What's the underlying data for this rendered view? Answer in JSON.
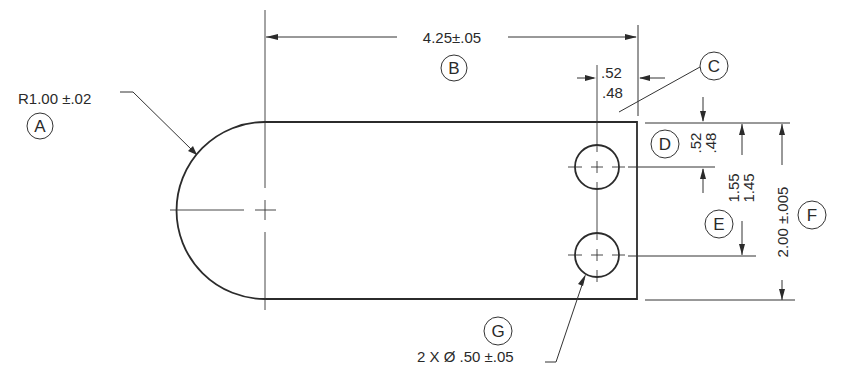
{
  "drawing": {
    "title": "Part drawing with dimension callouts",
    "callouts": [
      {
        "id": "A",
        "label": "A",
        "text": "R1.00 ±.02",
        "description": "Radius of rounded end"
      },
      {
        "id": "B",
        "label": "B",
        "text": "4.25±.05",
        "description": "Overall length from arc center to right edge"
      },
      {
        "id": "C",
        "label": "C",
        "text_upper": ".52",
        "text_lower": ".48",
        "description": "Hole center to right edge"
      },
      {
        "id": "D",
        "label": "D",
        "text_upper": ".52",
        "text_lower": ".48",
        "description": "Top edge to upper hole center"
      },
      {
        "id": "E",
        "label": "E",
        "text_upper": "1.55",
        "text_lower": "1.45",
        "description": "Top edge to lower hole center"
      },
      {
        "id": "F",
        "label": "F",
        "text": "2.00 ±.005",
        "description": "Overall height"
      },
      {
        "id": "G",
        "label": "G",
        "text": "2 X Ø .50 ±.05",
        "description": "Two hole diameters"
      }
    ]
  }
}
